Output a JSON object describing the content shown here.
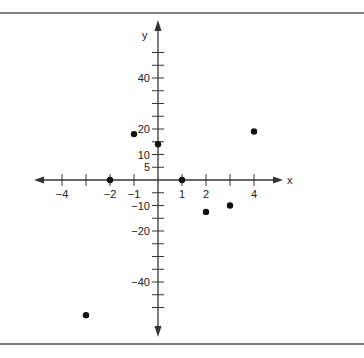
{
  "chart_data": {
    "type": "scatter",
    "title": "",
    "xlabel": "x",
    "ylabel": "y",
    "xlim": [
      -5,
      5
    ],
    "ylim": [
      -60,
      60
    ],
    "grid": false,
    "legend": null,
    "x_ticks": [
      -5,
      -4,
      -3,
      -2,
      -1,
      1,
      2,
      3,
      4
    ],
    "x_tick_labels": [
      {
        "value": -4,
        "label": "−4"
      },
      {
        "value": -2,
        "label": "−2"
      },
      {
        "value": -1,
        "label": "−1"
      },
      {
        "value": 1,
        "label": "1"
      },
      {
        "value": 2,
        "label": "2"
      },
      {
        "value": 4,
        "label": "4"
      }
    ],
    "y_ticks": [
      50,
      45,
      40,
      35,
      30,
      25,
      20,
      15,
      10,
      5,
      -5,
      -10,
      -15,
      -20,
      -25,
      -30,
      -35,
      -40,
      -45,
      -50
    ],
    "y_tick_labels": [
      {
        "value": 40,
        "label": "40"
      },
      {
        "value": 20,
        "label": "20"
      },
      {
        "value": 10,
        "label": "10"
      },
      {
        "value": 5,
        "label": "5"
      },
      {
        "value": -10,
        "label": "−10"
      },
      {
        "value": -20,
        "label": "−20"
      },
      {
        "value": -40,
        "label": "−40"
      }
    ],
    "series": [
      {
        "name": "points",
        "x": [
          -3,
          -2,
          -1,
          0,
          1,
          2,
          3,
          4
        ],
        "y": [
          -53,
          0,
          18,
          14,
          0,
          -12.5,
          -10,
          19
        ]
      }
    ]
  },
  "frame": {
    "border_color": "#555555",
    "axis_color": "#333333",
    "point_color": "#111111"
  }
}
